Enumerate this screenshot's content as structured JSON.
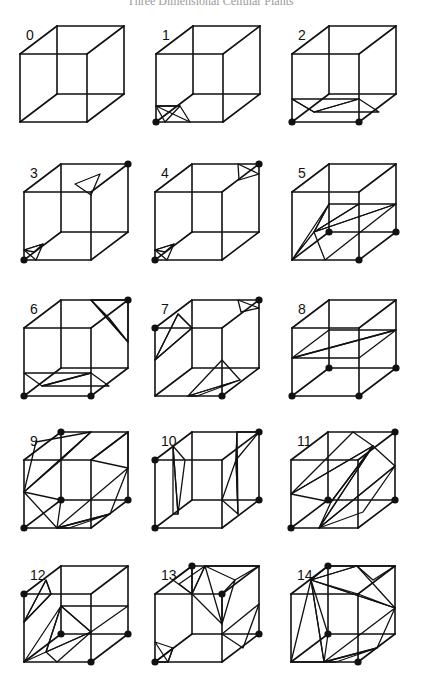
{
  "header": {
    "title": "Three Dimensional Cellular Plants"
  },
  "figure": {
    "colors": {
      "ink": "#111111",
      "background": "#ffffff"
    },
    "cubes": [
      {
        "label": "0",
        "origin": [
          20,
          54
        ],
        "dots": [],
        "tris": []
      },
      {
        "label": "1",
        "origin": [
          156,
          54
        ],
        "dots": [
          "FBL"
        ],
        "tris": [
          [
            [
              0,
              52
            ],
            [
              24,
              52
            ],
            [
              9,
              68
            ]
          ],
          [
            [
              0,
              52
            ],
            [
              34,
              68
            ],
            [
              24,
              52
            ]
          ]
        ]
      },
      {
        "label": "2",
        "origin": [
          292,
          54
        ],
        "dots": [
          "FBL",
          "FBR"
        ],
        "tris": [
          [
            [
              0,
              45
            ],
            [
              67,
              45
            ],
            [
              22,
              58
            ]
          ],
          [
            [
              22,
              58
            ],
            [
              67,
              45
            ],
            [
              87,
              58
            ]
          ],
          [
            [
              0,
              45
            ],
            [
              22,
              58
            ],
            [
              0,
              45
            ]
          ]
        ]
      },
      {
        "label": "3",
        "origin": [
          24,
          192
        ],
        "dots": [
          "FBL",
          "BTR"
        ],
        "tris": [
          [
            [
              0,
              58
            ],
            [
              12,
              68
            ],
            [
              19,
              52
            ]
          ],
          [
            [
              0,
              58
            ],
            [
              19,
              52
            ],
            [
              10,
              60
            ]
          ],
          [
            [
              51,
              -8
            ],
            [
              76,
              -18
            ],
            [
              67,
              3
            ]
          ]
        ]
      },
      {
        "label": "4",
        "origin": [
          155,
          192
        ],
        "dots": [
          "FBL",
          "BTR"
        ],
        "tris": [
          [
            [
              0,
              58
            ],
            [
              12,
              68
            ],
            [
              19,
              52
            ]
          ],
          [
            [
              0,
              58
            ],
            [
              19,
              52
            ],
            [
              10,
              60
            ]
          ],
          [
            [
              83,
              -28
            ],
            [
              104,
              -18
            ],
            [
              84,
              -12
            ]
          ]
        ]
      },
      {
        "label": "5",
        "origin": [
          292,
          192
        ],
        "dots": [
          "BBL",
          "FBR",
          "BBR"
        ],
        "tris": [
          [
            [
              37,
              12
            ],
            [
              0,
              68
            ],
            [
              22,
              40
            ]
          ],
          [
            [
              37,
              12
            ],
            [
              22,
              40
            ],
            [
              67,
              12
            ]
          ],
          [
            [
              22,
              40
            ],
            [
              67,
              12
            ],
            [
              104,
              12
            ]
          ],
          [
            [
              22,
              40
            ],
            [
              33,
              68
            ],
            [
              104,
              12
            ]
          ]
        ]
      },
      {
        "label": "6",
        "origin": [
          24,
          328
        ],
        "dots": [
          "FBL",
          "FBR",
          "BTR"
        ],
        "tris": [
          [
            [
              0,
              45
            ],
            [
              67,
              45
            ],
            [
              18,
              58
            ]
          ],
          [
            [
              18,
              58
            ],
            [
              67,
              45
            ],
            [
              85,
              58
            ]
          ],
          [
            [
              67,
              -28
            ],
            [
              104,
              -28
            ],
            [
              104,
              14
            ]
          ],
          [
            [
              67,
              -28
            ],
            [
              104,
              14
            ],
            [
              85,
              -10
            ]
          ]
        ]
      },
      {
        "label": "7",
        "origin": [
          155,
          328
        ],
        "dots": [
          "FTL",
          "BTR",
          "FBR"
        ],
        "tris": [
          [
            [
              0,
              32
            ],
            [
              23,
              -14
            ],
            [
              37,
              0
            ]
          ],
          [
            [
              0,
              32
            ],
            [
              37,
              0
            ],
            [
              23,
              -14
            ]
          ],
          [
            [
              83,
              -28
            ],
            [
              104,
              -20
            ],
            [
              86,
              -16
            ]
          ],
          [
            [
              33,
              68
            ],
            [
              67,
              32
            ],
            [
              85,
              52
            ]
          ],
          [
            [
              33,
              68
            ],
            [
              85,
              52
            ],
            [
              42,
              68
            ]
          ]
        ]
      },
      {
        "label": "8",
        "origin": [
          292,
          328
        ],
        "dots": [
          "FBL",
          "FBR",
          "BBL",
          "BBR"
        ],
        "tris": [
          [
            [
              0,
              30
            ],
            [
              37,
              2
            ],
            [
              104,
              2
            ]
          ],
          [
            [
              0,
              30
            ],
            [
              104,
              2
            ],
            [
              67,
              30
            ]
          ]
        ]
      },
      {
        "label": "9",
        "origin": [
          24,
          460
        ],
        "dots": [
          "BTL",
          "FBL",
          "BBL",
          "BBR"
        ],
        "tris": [
          [
            [
              0,
              32
            ],
            [
              12,
              -18
            ],
            [
              67,
              -28
            ]
          ],
          [
            [
              0,
              32
            ],
            [
              67,
              -28
            ],
            [
              37,
              0
            ]
          ],
          [
            [
              104,
              -28
            ],
            [
              104,
              8
            ],
            [
              67,
              0
            ]
          ],
          [
            [
              0,
              32
            ],
            [
              33,
              68
            ],
            [
              37,
              40
            ]
          ],
          [
            [
              33,
              68
            ],
            [
              104,
              8
            ],
            [
              86,
              54
            ]
          ],
          [
            [
              33,
              68
            ],
            [
              86,
              54
            ],
            [
              45,
              68
            ]
          ]
        ]
      },
      {
        "label": "10",
        "origin": [
          155,
          460
        ],
        "dots": [
          "FTL",
          "FBL",
          "BTR",
          "BBR"
        ],
        "tris": [
          [
            [
              18,
              -14
            ],
            [
              30,
              0
            ],
            [
              23,
              54
            ]
          ],
          [
            [
              18,
              -14
            ],
            [
              23,
              54
            ],
            [
              18,
              54
            ]
          ],
          [
            [
              82,
              -28
            ],
            [
              104,
              -28
            ],
            [
              81,
              0
            ]
          ],
          [
            [
              82,
              -28
            ],
            [
              81,
              0
            ],
            [
              83,
              54
            ]
          ],
          [
            [
              83,
              54
            ],
            [
              81,
              0
            ],
            [
              67,
              40
            ]
          ]
        ]
      },
      {
        "label": "11",
        "origin": [
          291,
          460
        ],
        "dots": [
          "FBL",
          "BBL",
          "BTR",
          "BBR"
        ],
        "tris": [
          [
            [
              0,
              34
            ],
            [
              82,
              -14
            ],
            [
              62,
              -28
            ]
          ],
          [
            [
              0,
              34
            ],
            [
              82,
              -14
            ],
            [
              40,
              42
            ]
          ],
          [
            [
              28,
              68
            ],
            [
              82,
              -14
            ],
            [
              40,
              42
            ]
          ],
          [
            [
              28,
              68
            ],
            [
              82,
              -14
            ],
            [
              104,
              6
            ]
          ],
          [
            [
              28,
              68
            ],
            [
              104,
              6
            ],
            [
              72,
              52
            ]
          ]
        ]
      },
      {
        "label": "12",
        "origin": [
          24,
          594
        ],
        "dots": [
          "FTL",
          "BBL",
          "FBR",
          "BBR"
        ],
        "tris": [
          [
            [
              0,
              28
            ],
            [
              22,
              -14
            ],
            [
              27,
              0
            ]
          ],
          [
            [
              0,
              28
            ],
            [
              27,
              0
            ],
            [
              22,
              -14
            ]
          ],
          [
            [
              37,
              12
            ],
            [
              22,
              58
            ],
            [
              67,
              38
            ]
          ],
          [
            [
              37,
              12
            ],
            [
              67,
              38
            ],
            [
              104,
              12
            ]
          ],
          [
            [
              22,
              58
            ],
            [
              33,
              68
            ],
            [
              67,
              38
            ]
          ],
          [
            [
              0,
              68
            ],
            [
              37,
              12
            ],
            [
              22,
              58
            ]
          ]
        ]
      },
      {
        "label": "13",
        "origin": [
          155,
          594
        ],
        "dots": [
          "BTL",
          "FTR",
          "FBL",
          "BBR"
        ],
        "tris": [
          [
            [
              18,
              -14
            ],
            [
              37,
              0
            ],
            [
              37,
              -28
            ]
          ],
          [
            [
              24,
              -10
            ],
            [
              37,
              0
            ],
            [
              50,
              -28
            ]
          ],
          [
            [
              37,
              0
            ],
            [
              67,
              30
            ],
            [
              50,
              -28
            ]
          ],
          [
            [
              50,
              -28
            ],
            [
              80,
              -14
            ],
            [
              104,
              -28
            ]
          ],
          [
            [
              67,
              30
            ],
            [
              80,
              -14
            ],
            [
              67,
              0
            ]
          ],
          [
            [
              67,
              40
            ],
            [
              104,
              10
            ],
            [
              88,
              54
            ]
          ],
          [
            [
              0,
              48
            ],
            [
              13,
              68
            ],
            [
              18,
              54
            ]
          ],
          [
            [
              0,
              68
            ],
            [
              18,
              54
            ],
            [
              13,
              68
            ]
          ]
        ]
      },
      {
        "label": "14",
        "origin": [
          291,
          594
        ],
        "dots": [
          "BTL",
          "BBL",
          "FBR"
        ],
        "tris": [
          [
            [
              20,
              -14
            ],
            [
              37,
              -28
            ],
            [
              66,
              -28
            ]
          ],
          [
            [
              20,
              -14
            ],
            [
              66,
              -28
            ],
            [
              104,
              14
            ]
          ],
          [
            [
              20,
              -14
            ],
            [
              104,
              14
            ],
            [
              67,
              0
            ]
          ],
          [
            [
              66,
              -28
            ],
            [
              104,
              -28
            ],
            [
              82,
              -14
            ]
          ],
          [
            [
              20,
              -14
            ],
            [
              33,
              68
            ],
            [
              0,
              68
            ]
          ],
          [
            [
              20,
              -14
            ],
            [
              33,
              68
            ],
            [
              37,
              40
            ]
          ],
          [
            [
              33,
              68
            ],
            [
              104,
              14
            ],
            [
              86,
              54
            ]
          ],
          [
            [
              33,
              68
            ],
            [
              86,
              54
            ],
            [
              45,
              68
            ]
          ]
        ]
      }
    ]
  }
}
